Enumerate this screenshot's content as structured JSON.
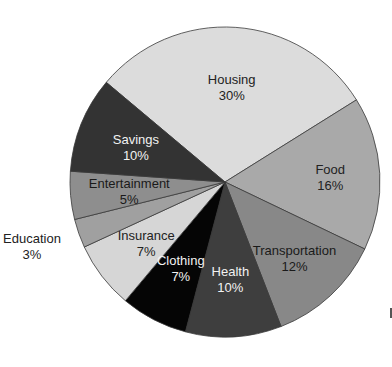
{
  "chart_data": {
    "type": "pie",
    "title": "",
    "start_angle_deg": -50,
    "direction": "clockwise",
    "slices": [
      {
        "label": "Housing",
        "value": 30,
        "display": "30%",
        "color": "#dcdcdc",
        "text_color": "#222222"
      },
      {
        "label": "Food",
        "value": 16,
        "display": "16%",
        "color": "#a9a9a9",
        "text_color": "#222222"
      },
      {
        "label": "Transportation",
        "value": 12,
        "display": "12%",
        "color": "#888888",
        "text_color": "#1a1a1a"
      },
      {
        "label": "Health",
        "value": 10,
        "display": "10%",
        "color": "#3e3e3e",
        "text_color": "#f2f2f2"
      },
      {
        "label": "Clothing",
        "value": 7,
        "display": "7%",
        "color": "#050505",
        "text_color": "#f2f2f2"
      },
      {
        "label": "Insurance",
        "value": 7,
        "display": "7%",
        "color": "#d6d6d6",
        "text_color": "#222222"
      },
      {
        "label": "Education",
        "value": 3,
        "display": "3%",
        "color": "#a0a0a0",
        "text_color": "#222222",
        "label_outside": true
      },
      {
        "label": "Entertainment",
        "value": 5,
        "display": "5%",
        "color": "#8e8e8e",
        "text_color": "#1a1a1a"
      },
      {
        "label": "Savings",
        "value": 10,
        "display": "10%",
        "color": "#333333",
        "text_color": "#f2f2f2"
      }
    ],
    "legend": "none"
  }
}
